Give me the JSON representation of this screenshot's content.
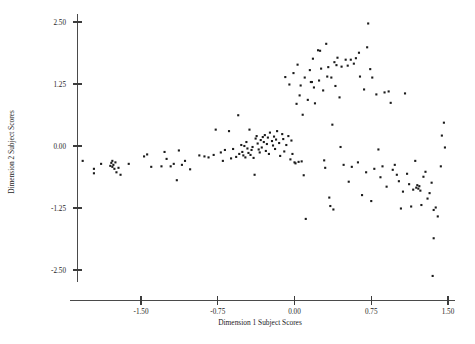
{
  "chart_data": {
    "type": "scatter",
    "title": "",
    "xlabel": "Dimension 1 Subject Scores",
    "ylabel": "Dimension 2 Subject Scores",
    "xlim": [
      -2.13,
      1.72
    ],
    "ylim": [
      -2.92,
      2.72
    ],
    "xticks": [
      -1.5,
      -0.75,
      0.0,
      0.75,
      1.5
    ],
    "xticklabels": [
      "-1.50",
      "-0.75",
      "0.00",
      "0.75",
      "1.50"
    ],
    "yticks": [
      2.5,
      1.25,
      0.0,
      -1.25,
      -2.5
    ],
    "yticklabels": [
      "2.50",
      "1.25",
      "0.00",
      "-1.25",
      "-2.50"
    ],
    "grid": false,
    "legend": null,
    "marker": "square",
    "marker_color": "#1b1b1b",
    "marker_size": 2.1,
    "n_points": 185,
    "points": [
      [
        -2.07,
        -0.3
      ],
      [
        -1.96,
        -0.46
      ],
      [
        -1.96,
        -0.55
      ],
      [
        -1.89,
        -0.36
      ],
      [
        -1.8,
        -0.4
      ],
      [
        -1.79,
        -0.34
      ],
      [
        -1.78,
        -0.42
      ],
      [
        -1.78,
        -0.3
      ],
      [
        -1.77,
        -0.38
      ],
      [
        -1.76,
        -0.46
      ],
      [
        -1.75,
        -0.33
      ],
      [
        -1.74,
        -0.53
      ],
      [
        -1.72,
        -0.44
      ],
      [
        -1.7,
        -0.58
      ],
      [
        -1.62,
        -0.36
      ],
      [
        -1.47,
        -0.21
      ],
      [
        -1.44,
        -0.17
      ],
      [
        -1.4,
        -0.42
      ],
      [
        -1.3,
        -0.41
      ],
      [
        -1.27,
        -0.12
      ],
      [
        -1.25,
        -0.26
      ],
      [
        -1.21,
        -0.41
      ],
      [
        -1.18,
        -0.36
      ],
      [
        -1.15,
        -0.69
      ],
      [
        -1.13,
        -0.09
      ],
      [
        -1.1,
        -0.38
      ],
      [
        -1.07,
        -0.3
      ],
      [
        -1.02,
        -0.47
      ],
      [
        -0.93,
        -0.19
      ],
      [
        -0.88,
        -0.21
      ],
      [
        -0.84,
        -0.23
      ],
      [
        -0.79,
        -0.18
      ],
      [
        -0.77,
        0.33
      ],
      [
        -0.72,
        -0.13
      ],
      [
        -0.7,
        -0.3
      ],
      [
        -0.68,
        -0.08
      ],
      [
        -0.64,
        0.3
      ],
      [
        -0.62,
        -0.25
      ],
      [
        -0.6,
        -0.06
      ],
      [
        -0.57,
        -0.22
      ],
      [
        -0.55,
        0.62
      ],
      [
        -0.54,
        -0.16
      ],
      [
        -0.52,
        0.02
      ],
      [
        -0.51,
        -0.12
      ],
      [
        -0.5,
        -0.19
      ],
      [
        -0.49,
        0.0
      ],
      [
        -0.48,
        -0.23
      ],
      [
        -0.47,
        0.08
      ],
      [
        -0.46,
        -0.05
      ],
      [
        -0.45,
        -0.14
      ],
      [
        -0.44,
        0.33
      ],
      [
        -0.43,
        -0.18
      ],
      [
        -0.42,
        -0.08
      ],
      [
        -0.41,
        -0.02
      ],
      [
        -0.4,
        -0.24
      ],
      [
        -0.39,
        -0.58
      ],
      [
        -0.38,
        0.15
      ],
      [
        -0.37,
        0.2
      ],
      [
        -0.36,
        0.05
      ],
      [
        -0.35,
        -0.07
      ],
      [
        -0.34,
        -0.13
      ],
      [
        -0.33,
        0.12
      ],
      [
        -0.32,
        -0.03
      ],
      [
        -0.31,
        0.18
      ],
      [
        -0.3,
        0.08
      ],
      [
        -0.29,
        0.22
      ],
      [
        -0.28,
        -0.1
      ],
      [
        -0.27,
        0.04
      ],
      [
        -0.26,
        0.17
      ],
      [
        -0.25,
        -0.16
      ],
      [
        -0.24,
        0.27
      ],
      [
        -0.22,
        0.1
      ],
      [
        -0.21,
        0.01
      ],
      [
        -0.2,
        0.19
      ],
      [
        -0.19,
        -0.06
      ],
      [
        -0.18,
        0.13
      ],
      [
        -0.17,
        0.3
      ],
      [
        -0.15,
        0.06
      ],
      [
        -0.14,
        -0.2
      ],
      [
        -0.12,
        0.24
      ],
      [
        -0.11,
        0.14
      ],
      [
        -0.1,
        -0.11
      ],
      [
        -0.09,
        1.39
      ],
      [
        -0.08,
        0.02
      ],
      [
        -0.06,
        0.2
      ],
      [
        -0.05,
        1.24
      ],
      [
        -0.04,
        -0.27
      ],
      [
        -0.03,
        0.11
      ],
      [
        -0.02,
        -0.16
      ],
      [
        -0.01,
        1.47
      ],
      [
        0.0,
        -0.33
      ],
      [
        0.01,
        -0.35
      ],
      [
        0.02,
        0.85
      ],
      [
        0.03,
        1.64
      ],
      [
        0.04,
        -0.32
      ],
      [
        0.05,
        1.02
      ],
      [
        0.06,
        1.22
      ],
      [
        0.07,
        -0.31
      ],
      [
        0.08,
        0.63
      ],
      [
        0.09,
        -0.59
      ],
      [
        0.1,
        1.38
      ],
      [
        0.11,
        -1.47
      ],
      [
        0.13,
        0.93
      ],
      [
        0.15,
        1.53
      ],
      [
        0.16,
        1.29
      ],
      [
        0.17,
        1.29
      ],
      [
        0.18,
        1.76
      ],
      [
        0.19,
        1.18
      ],
      [
        0.2,
        0.86
      ],
      [
        0.23,
        1.93
      ],
      [
        0.24,
        1.32
      ],
      [
        0.25,
        1.92
      ],
      [
        0.26,
        1.56
      ],
      [
        0.28,
        1.12
      ],
      [
        0.29,
        -0.29
      ],
      [
        0.3,
        -0.44
      ],
      [
        0.31,
        2.06
      ],
      [
        0.32,
        1.4
      ],
      [
        0.33,
        1.59
      ],
      [
        0.34,
        -1.04
      ],
      [
        0.35,
        -1.21
      ],
      [
        0.36,
        1.38
      ],
      [
        0.37,
        0.43
      ],
      [
        0.38,
        -1.28
      ],
      [
        0.39,
        1.69
      ],
      [
        0.4,
        1.21
      ],
      [
        0.41,
        1.63
      ],
      [
        0.42,
        1.78
      ],
      [
        0.44,
        0.98
      ],
      [
        0.45,
        -0.02
      ],
      [
        0.46,
        1.6
      ],
      [
        0.48,
        -0.38
      ],
      [
        0.5,
        1.74
      ],
      [
        0.52,
        1.62
      ],
      [
        0.53,
        -0.72
      ],
      [
        0.55,
        1.74
      ],
      [
        0.56,
        -0.42
      ],
      [
        0.58,
        1.66
      ],
      [
        0.6,
        1.77
      ],
      [
        0.62,
        -0.33
      ],
      [
        0.63,
        1.88
      ],
      [
        0.64,
        1.4
      ],
      [
        0.66,
        -0.99
      ],
      [
        0.68,
        1.14
      ],
      [
        0.7,
        -0.53
      ],
      [
        0.71,
        1.99
      ],
      [
        0.72,
        2.47
      ],
      [
        0.74,
        1.55
      ],
      [
        0.75,
        -1.11
      ],
      [
        0.76,
        1.38
      ],
      [
        0.78,
        -0.46
      ],
      [
        0.8,
        1.04
      ],
      [
        0.82,
        -0.07
      ],
      [
        0.84,
        -0.63
      ],
      [
        0.86,
        -0.41
      ],
      [
        0.88,
        1.08
      ],
      [
        0.9,
        -0.82
      ],
      [
        0.92,
        1.1
      ],
      [
        0.94,
        0.87
      ],
      [
        0.96,
        -0.48
      ],
      [
        0.98,
        -0.38
      ],
      [
        1.0,
        -0.58
      ],
      [
        1.02,
        -0.71
      ],
      [
        1.04,
        -1.26
      ],
      [
        1.06,
        -0.92
      ],
      [
        1.08,
        1.06
      ],
      [
        1.1,
        -0.56
      ],
      [
        1.12,
        -0.77
      ],
      [
        1.14,
        -1.22
      ],
      [
        1.16,
        -0.88
      ],
      [
        1.18,
        -0.3
      ],
      [
        1.19,
        -0.84
      ],
      [
        1.2,
        -0.79
      ],
      [
        1.21,
        -0.86
      ],
      [
        1.22,
        -0.81
      ],
      [
        1.23,
        -0.9
      ],
      [
        1.24,
        -1.19
      ],
      [
        1.26,
        -0.62
      ],
      [
        1.28,
        -0.52
      ],
      [
        1.3,
        -1.06
      ],
      [
        1.32,
        -0.95
      ],
      [
        1.34,
        -0.74
      ],
      [
        1.36,
        -1.29
      ],
      [
        1.38,
        -1.24
      ],
      [
        1.4,
        -1.42
      ],
      [
        1.36,
        -1.86
      ],
      [
        1.35,
        -2.62
      ],
      [
        1.44,
        0.21
      ],
      [
        1.46,
        0.47
      ],
      [
        1.47,
        -0.03
      ],
      [
        1.43,
        -0.41
      ]
    ]
  },
  "axes": {
    "x_title": "Dimension 1 Subject Scores",
    "y_title": "Dimension 2 Subject Scores"
  }
}
